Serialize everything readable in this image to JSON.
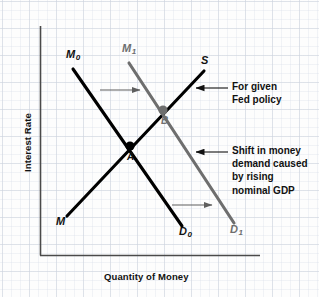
{
  "figure": {
    "type": "money-market-diagram",
    "background": "#fdfdfd",
    "grid": "graph-paper-light-gray"
  },
  "axes": {
    "y_title": "Interest Rate",
    "x_title": "Quantity of Money",
    "color": "#4a4a4a",
    "origin": {
      "x": 40,
      "y": 255
    },
    "x_end": {
      "x": 260,
      "y": 255
    },
    "y_top": {
      "x": 40,
      "y": 26
    }
  },
  "curves": [
    {
      "id": "m0",
      "label": "M",
      "subscript": "0",
      "role": "money-demand-initial",
      "color": "#000000",
      "from": {
        "x": 72,
        "y": 68
      },
      "to": {
        "x": 182,
        "y": 225
      }
    },
    {
      "id": "m1",
      "label": "M",
      "subscript": "1",
      "role": "money-demand-shifted",
      "color": "#6e6e6e",
      "from": {
        "x": 128,
        "y": 62
      },
      "to": {
        "x": 233,
        "y": 222
      }
    },
    {
      "id": "supply",
      "label": "S",
      "subscript": "",
      "role": "money-supply-upper-label",
      "color": "#000000",
      "from": {
        "x": 67,
        "y": 215
      },
      "to": {
        "x": 203,
        "y": 72
      }
    },
    {
      "id": "supply-lower",
      "label": "M",
      "subscript": "",
      "role": "money-supply-lower-label",
      "color": "#000000"
    },
    {
      "id": "d0",
      "label": "D",
      "subscript": "0",
      "role": "demand-lower-label-initial",
      "color": "#000000"
    },
    {
      "id": "d1",
      "label": "D",
      "subscript": "1",
      "role": "demand-lower-label-shifted",
      "color": "#6e6e6e"
    }
  ],
  "points": [
    {
      "id": "a",
      "label": "A",
      "color": "#000000",
      "x": 130,
      "y": 146
    },
    {
      "id": "b",
      "label": "B",
      "color": "#6e6e6e",
      "x": 163,
      "y": 110
    }
  ],
  "shift_arrows": [
    {
      "id": "upper",
      "color": "#6e6e6e",
      "x1": 100,
      "y1": 90,
      "x2": 140,
      "y2": 90
    },
    {
      "id": "lower",
      "color": "#6e6e6e",
      "x1": 172,
      "y1": 205,
      "x2": 212,
      "y2": 205
    }
  ],
  "annotations": [
    {
      "id": "fed-policy",
      "lines": [
        "For given",
        "Fed policy"
      ],
      "text": "For given Fed policy",
      "arrow": {
        "tip_x": 196,
        "tail_x": 228,
        "y": 88
      },
      "text_x": 232,
      "text_y": 82
    },
    {
      "id": "money-demand-shift",
      "lines": [
        "Shift in money",
        "demand caused",
        "by rising",
        "nominal GDP"
      ],
      "text": "Shift in money demand caused by rising nominal GDP",
      "arrow": {
        "tip_x": 196,
        "tail_x": 228,
        "y": 152
      },
      "text_x": 232,
      "text_y": 146
    }
  ],
  "colors": {
    "black": "#000000",
    "gray": "#6e6e6e",
    "axis": "#4a4a4a",
    "grid": "#ced4de"
  }
}
